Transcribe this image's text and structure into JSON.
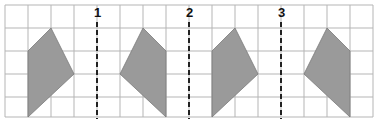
{
  "diagram": {
    "grid": {
      "origin_x": 5,
      "origin_y": 5,
      "cell": 23,
      "cols": 16,
      "rows": 5,
      "line_color": "#b5b5b5"
    },
    "shape_fill": "#9a9a9a",
    "shape_stroke": "#7a7a7a",
    "mirror_lines": [
      {
        "label": "1",
        "col": 4
      },
      {
        "label": "2",
        "col": 8
      },
      {
        "label": "3",
        "col": 12
      }
    ],
    "shapes": [
      {
        "name": "shape-a",
        "points": [
          [
            2,
            1
          ],
          [
            3,
            3
          ],
          [
            1,
            5
          ],
          [
            1,
            2
          ]
        ]
      },
      {
        "name": "shape-b",
        "points": [
          [
            6,
            1
          ],
          [
            7,
            2
          ],
          [
            7,
            5
          ],
          [
            5,
            3
          ]
        ]
      },
      {
        "name": "shape-c",
        "points": [
          [
            10,
            1
          ],
          [
            11,
            3
          ],
          [
            9,
            5
          ],
          [
            9,
            2
          ]
        ]
      },
      {
        "name": "shape-d",
        "points": [
          [
            14,
            1
          ],
          [
            15,
            2
          ],
          [
            15,
            5
          ],
          [
            13,
            3
          ]
        ]
      }
    ]
  }
}
